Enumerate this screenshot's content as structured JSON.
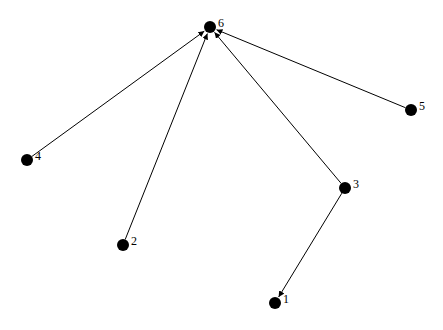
{
  "graph": {
    "nodes": [
      {
        "id": "1",
        "label": "1",
        "x": 275,
        "y": 303
      },
      {
        "id": "2",
        "label": "2",
        "x": 123,
        "y": 245
      },
      {
        "id": "3",
        "label": "3",
        "x": 345,
        "y": 188
      },
      {
        "id": "4",
        "label": "4",
        "x": 27,
        "y": 160
      },
      {
        "id": "5",
        "label": "5",
        "x": 411,
        "y": 110
      },
      {
        "id": "6",
        "label": "6",
        "x": 210,
        "y": 27
      }
    ],
    "edges": [
      {
        "from": "4",
        "to": "6"
      },
      {
        "from": "2",
        "to": "6"
      },
      {
        "from": "3",
        "to": "6"
      },
      {
        "from": "5",
        "to": "6"
      },
      {
        "from": "3",
        "to": "1"
      }
    ],
    "colors": {
      "node": "#000000",
      "edge": "#000000",
      "background": "#ffffff"
    }
  }
}
